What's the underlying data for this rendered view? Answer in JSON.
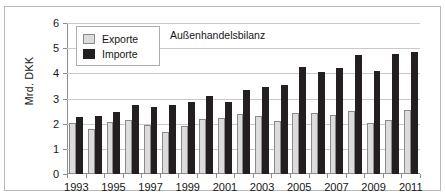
{
  "chart_data": {
    "type": "bar",
    "title": "Außenhandelsbilanz",
    "xlabel": "",
    "ylabel": "Mrd. DKK",
    "ylim": [
      0,
      6
    ],
    "yticks": [
      0,
      1,
      2,
      3,
      4,
      5,
      6
    ],
    "grid": true,
    "legend_position": "top-left",
    "categories": [
      "1993",
      "1994",
      "1995",
      "1996",
      "1997",
      "1998",
      "1999",
      "2000",
      "2001",
      "2002",
      "2003",
      "2004",
      "2005",
      "2006",
      "2007",
      "2008",
      "2009",
      "2010",
      "2011"
    ],
    "xtick_labels": [
      "1993",
      "1995",
      "1997",
      "1999",
      "2001",
      "2003",
      "2005",
      "2007",
      "2009",
      "2011"
    ],
    "series": [
      {
        "name": "Exporte",
        "color": "#dcdcdc",
        "values": [
          2.02,
          1.78,
          2.08,
          2.14,
          1.93,
          1.68,
          1.92,
          2.2,
          2.21,
          2.37,
          2.29,
          2.12,
          2.41,
          2.41,
          2.33,
          2.5,
          2.01,
          2.16,
          2.54
        ]
      },
      {
        "name": "Importe",
        "color": "#231f20",
        "values": [
          2.25,
          2.32,
          2.46,
          2.74,
          2.65,
          2.76,
          2.88,
          3.11,
          2.88,
          3.32,
          3.46,
          3.55,
          4.26,
          4.07,
          4.22,
          4.71,
          4.09,
          4.78,
          4.84
        ]
      }
    ]
  },
  "legend": {
    "items": [
      {
        "label": "Exporte",
        "swatch": "export"
      },
      {
        "label": "Importe",
        "swatch": "import"
      }
    ]
  }
}
